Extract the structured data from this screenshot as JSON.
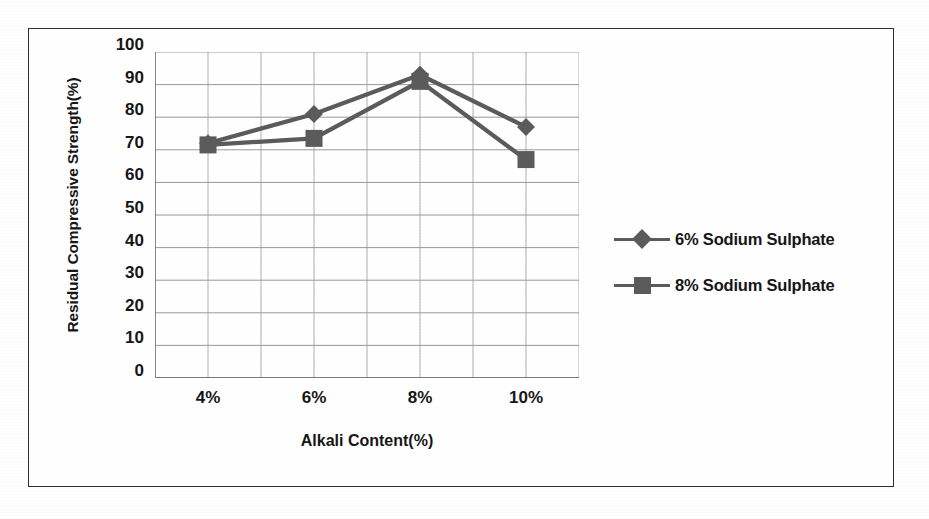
{
  "figure": {
    "border_color": "#2f2f2f",
    "background": "#ffffff"
  },
  "chart_data": {
    "type": "line",
    "title": "",
    "xlabel": "Alkali Content(%)",
    "ylabel": "Residual Compressive Strength(%)",
    "categories": [
      "4%",
      "6%",
      "8%",
      "10%"
    ],
    "ylim": [
      0,
      100
    ],
    "ytick_step": 10,
    "yticks": [
      "100",
      "90",
      "80",
      "70",
      "60",
      "50",
      "40",
      "30",
      "20",
      "10",
      "0"
    ],
    "grid": "both",
    "legend_position": "right",
    "series_color": "#5b5b5b",
    "series": [
      {
        "name": "6% Sodium Sulphate",
        "marker": "diamond",
        "color": "#5b5b5b",
        "values": [
          72,
          81,
          93,
          77
        ]
      },
      {
        "name": "8% Sodium Sulphate",
        "marker": "square",
        "color": "#5b5b5b",
        "values": [
          71.5,
          73.5,
          91,
          67
        ]
      }
    ]
  },
  "legend": {
    "items": [
      {
        "label": "6% Sodium Sulphate",
        "marker": "diamond"
      },
      {
        "label": "8% Sodium Sulphate",
        "marker": "square"
      }
    ]
  }
}
